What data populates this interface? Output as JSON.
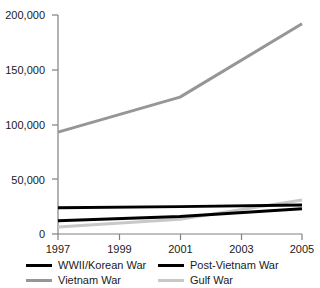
{
  "chart_data": {
    "type": "line",
    "title": "",
    "subtitle": "",
    "xlabel": "",
    "ylabel": "",
    "x": [
      1997,
      1998,
      1999,
      2000,
      2001,
      2002,
      2003,
      2004,
      2005
    ],
    "xlim": [
      1997,
      2005
    ],
    "ylim": [
      0,
      200000
    ],
    "grid": false,
    "legend_position": "bottom",
    "x_tick_labels": [
      "1997",
      "1999",
      "2001",
      "2003",
      "2005"
    ],
    "x_ticks": [
      1997,
      1999,
      2001,
      2003,
      2005
    ],
    "y_tick_labels": [
      "0",
      "50,000",
      "100,000",
      "150,000",
      "200,000"
    ],
    "y_ticks": [
      0,
      50000,
      100000,
      150000,
      200000
    ],
    "series": [
      {
        "name": "WWII/Korean War",
        "color": "#000000",
        "width": 3.0,
        "x": [
          1997,
          2001,
          2005
        ],
        "values": [
          24000,
          25000,
          26500
        ]
      },
      {
        "name": "Post-Vietnam War",
        "color": "#000000",
        "width": 3.0,
        "x": [
          1997,
          2001,
          2005
        ],
        "values": [
          12000,
          16000,
          23000
        ]
      },
      {
        "name": "Vietnam War",
        "color": "#969696",
        "width": 3.0,
        "x": [
          1997,
          2001,
          2005
        ],
        "values": [
          93000,
          125000,
          192000
        ]
      },
      {
        "name": "Gulf War",
        "color": "#c8c8c8",
        "width": 3.0,
        "x": [
          1997,
          2001,
          2005
        ],
        "values": [
          6500,
          13500,
          31000
        ]
      }
    ]
  },
  "legend": {
    "entries": [
      {
        "label": "WWII/Korean War",
        "color": "#000000"
      },
      {
        "label": "Post-Vietnam War",
        "color": "#000000"
      },
      {
        "label": "Vietnam War",
        "color": "#969696"
      },
      {
        "label": "Gulf War",
        "color": "#c8c8c8"
      }
    ]
  },
  "axes": {
    "axis_color": "#808080",
    "tick_color": "#808080"
  }
}
